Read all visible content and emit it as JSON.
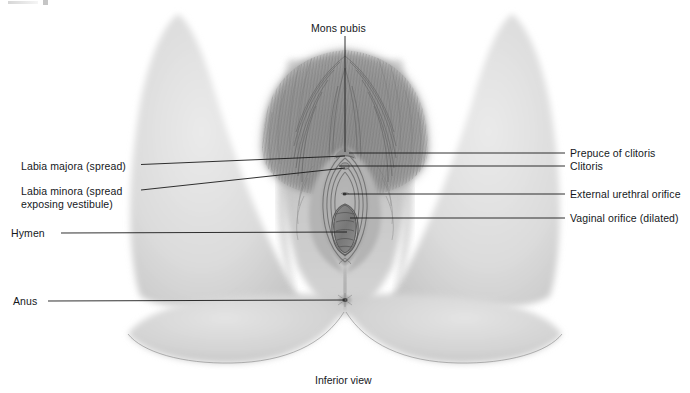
{
  "figure": {
    "title_caption": "Inferior view",
    "view": "Inferior view",
    "style": "greyscale medical illustration",
    "colors": {
      "background": "#ffffff",
      "skin_light": "#dcdcdc",
      "skin_mid": "#c9c9c9",
      "skin_shadow": "#b0b0b0",
      "hair_mid": "#8a8a8a",
      "hair_dark": "#6a6a6a",
      "line": "#1a1a1a",
      "text": "#15181c"
    }
  },
  "labels": {
    "top": [
      {
        "id": "mons-pubis",
        "text": "Mons pubis",
        "x": 311,
        "y": 22,
        "side": "top"
      }
    ],
    "left": [
      {
        "id": "labia-majora",
        "text": "Labia majora (spread)",
        "x": 21,
        "y": 160,
        "side": "left"
      },
      {
        "id": "labia-minora",
        "text": "Labia minora (spread",
        "text2": "exposing vestibule)",
        "x": 21,
        "y": 188,
        "side": "left"
      },
      {
        "id": "hymen",
        "text": "Hymen",
        "x": 11,
        "y": 228,
        "side": "left"
      },
      {
        "id": "anus",
        "text": "Anus",
        "x": 13,
        "y": 296,
        "side": "left"
      }
    ],
    "right": [
      {
        "id": "prepuce-of-clitoris",
        "text": "Prepuce of clitoris",
        "x": 570,
        "y": 148,
        "side": "right"
      },
      {
        "id": "clitoris",
        "text": "Clitoris",
        "x": 570,
        "y": 161,
        "side": "right"
      },
      {
        "id": "external-urethral-orifice",
        "text": "External urethral orifice",
        "x": 570,
        "y": 189,
        "side": "right"
      },
      {
        "id": "vaginal-orifice",
        "text": "Vaginal orifice (dilated)",
        "x": 570,
        "y": 213,
        "side": "right"
      }
    ],
    "bottom": [
      {
        "id": "inferior-view",
        "text": "Inferior view",
        "x": 315,
        "y": 375,
        "side": "bottom"
      }
    ]
  },
  "leader_lines": [
    {
      "id": "mons-pubis-leader",
      "points": "345,36 345,152"
    },
    {
      "id": "labia-majora-leader",
      "points": "141,164 345,156"
    },
    {
      "id": "labia-minora-leader",
      "points": "141,190 345,168"
    },
    {
      "id": "hymen-leader",
      "points": "61,233 347,232"
    },
    {
      "id": "anus-leader",
      "points": "48,301 345,300"
    },
    {
      "id": "prepuce-leader",
      "points": "565,153 349,153"
    },
    {
      "id": "clitoris-leader",
      "points": "565,166 339,166"
    },
    {
      "id": "urethral-leader",
      "points": "565,194 343,194"
    },
    {
      "id": "vaginal-leader",
      "points": "565,218 350,218"
    }
  ],
  "anatomy_parts": [
    {
      "id": "left-thigh",
      "name": "left thigh"
    },
    {
      "id": "right-thigh",
      "name": "right thigh"
    },
    {
      "id": "mons-pubis-region",
      "name": "mons pubis with pubic hair"
    },
    {
      "id": "vulva",
      "name": "vulva / vestibule"
    },
    {
      "id": "left-buttock",
      "name": "left buttock"
    },
    {
      "id": "right-buttock",
      "name": "right buttock"
    },
    {
      "id": "perineum",
      "name": "perineum"
    },
    {
      "id": "anus-point",
      "name": "anus"
    }
  ]
}
